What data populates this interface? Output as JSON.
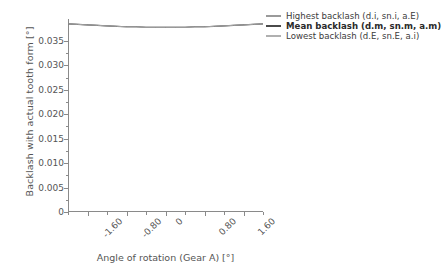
{
  "chart_data": {
    "type": "line",
    "title": "",
    "xlabel": "Angle of rotation (Gear A) [°]",
    "ylabel": "Backlash with actual tooth form [°]",
    "xlim": [
      -2.0,
      2.0
    ],
    "ylim": [
      0,
      0.0395
    ],
    "grid": false,
    "legend_position": "right",
    "xticks": [
      "-1.60",
      "-0.80",
      "0",
      "0.80",
      "1.60"
    ],
    "xtick_values": [
      -1.6,
      -0.8,
      0,
      0.8,
      1.6
    ],
    "yticks": [
      "0",
      "0.005",
      "0.010",
      "0.015",
      "0.020",
      "0.025",
      "0.030",
      "0.035"
    ],
    "ytick_values": [
      0,
      0.005,
      0.01,
      0.015,
      0.02,
      0.025,
      0.03,
      0.035
    ],
    "x": [
      -2.0,
      -1.8,
      -1.6,
      -1.4,
      -1.2,
      -1.0,
      -0.8,
      -0.6,
      -0.4,
      -0.2,
      0.0,
      0.2,
      0.4,
      0.6,
      0.8,
      1.0,
      1.2,
      1.4,
      1.6,
      1.8,
      2.0
    ],
    "series": [
      {
        "name": "Highest backlash (d.i, sn.i, a.E)",
        "color": "#9a9a9a",
        "bold": false,
        "values": [
          0.0385,
          0.0384,
          0.0383,
          0.0382,
          0.0381,
          0.038,
          0.0379,
          0.0379,
          0.0378,
          0.0378,
          0.0378,
          0.0378,
          0.0378,
          0.0379,
          0.0379,
          0.038,
          0.0381,
          0.0382,
          0.0383,
          0.0384,
          0.0385
        ]
      },
      {
        "name": "Mean backlash (d.m, sn.m, a.m)",
        "color": "#4a4a4a",
        "bold": true,
        "values": [
          0.0385,
          0.0384,
          0.0383,
          0.0382,
          0.0381,
          0.038,
          0.0379,
          0.0379,
          0.0378,
          0.0378,
          0.0378,
          0.0378,
          0.0378,
          0.0379,
          0.0379,
          0.038,
          0.0381,
          0.0382,
          0.0383,
          0.0384,
          0.0385
        ]
      },
      {
        "name": "Lowest backlash (d.E, sn.E, a.i)",
        "color": "#b0b0b0",
        "bold": false,
        "values": [
          0.0385,
          0.0384,
          0.0383,
          0.0382,
          0.0381,
          0.038,
          0.0379,
          0.0379,
          0.0378,
          0.0378,
          0.0378,
          0.0378,
          0.0378,
          0.0379,
          0.0379,
          0.038,
          0.0381,
          0.0382,
          0.0383,
          0.0384,
          0.0385
        ]
      }
    ]
  },
  "axis": {
    "color": "#8a8a8a"
  }
}
